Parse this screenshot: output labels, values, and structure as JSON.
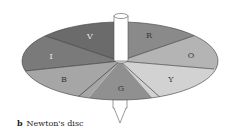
{
  "figure": {
    "caption_letter": "b",
    "caption_text": "Newton's disc"
  },
  "disc": {
    "segments": [
      {
        "label": "V",
        "color": "#6b6b6b"
      },
      {
        "label": "R",
        "color": "#8a8a8a"
      },
      {
        "label": "O",
        "color": "#b4b4b4"
      },
      {
        "label": "Y",
        "color": "#d2d2d2"
      },
      {
        "label": "G",
        "color": "#909090"
      },
      {
        "label": "B",
        "color": "#a6a6a6"
      },
      {
        "label": "I",
        "color": "#7a7a7a"
      }
    ]
  }
}
